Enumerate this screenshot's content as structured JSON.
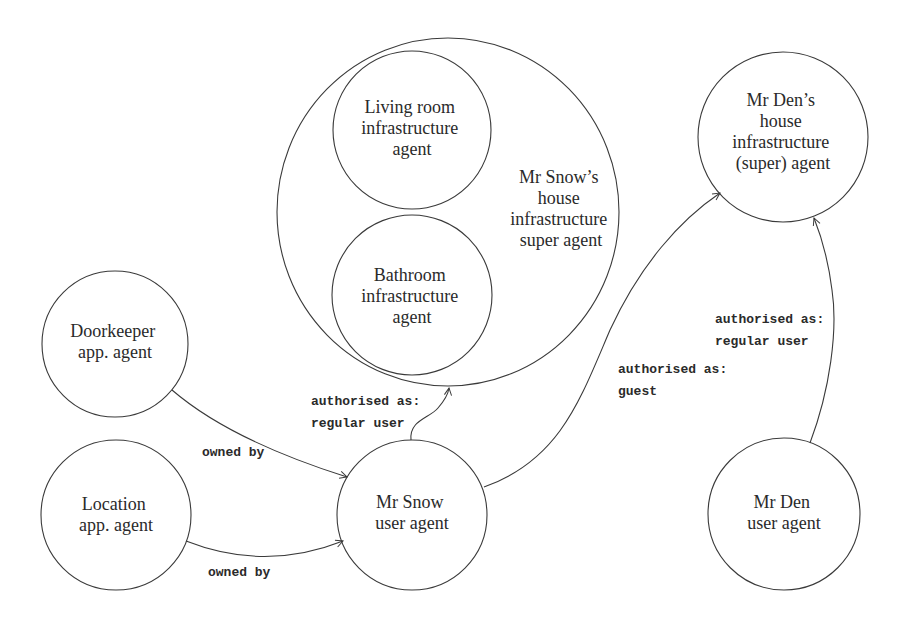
{
  "diagram": {
    "nodes": {
      "snow_house": {
        "lines": [
          "Mr Snow’s",
          "house",
          "infrastructure",
          "super agent"
        ]
      },
      "living_room": {
        "lines": [
          "Living room",
          "infrastructure",
          "agent"
        ]
      },
      "bathroom": {
        "lines": [
          "Bathroom",
          "infrastructure",
          "agent"
        ]
      },
      "den_house": {
        "lines": [
          "Mr Den’s",
          "house",
          "infrastructure",
          "(super) agent"
        ]
      },
      "doorkeeper": {
        "lines": [
          "Doorkeeper",
          "app. agent"
        ]
      },
      "location": {
        "lines": [
          "Location",
          "app. agent"
        ]
      },
      "snow_user": {
        "lines": [
          "Mr Snow",
          "user agent"
        ]
      },
      "den_user": {
        "lines": [
          "Mr Den",
          "user agent"
        ]
      }
    },
    "edges": {
      "doorkeeper_to_snow": {
        "from": "Doorkeeper app. agent",
        "to": "Mr Snow user agent",
        "lines": [
          "owned by"
        ]
      },
      "location_to_snow": {
        "from": "Location app. agent",
        "to": "Mr Snow user agent",
        "lines": [
          "owned by"
        ]
      },
      "snow_to_snow_house": {
        "from": "Mr Snow user agent",
        "to": "Mr Snow’s house infrastructure super agent",
        "lines": [
          "authorised as:",
          "regular user"
        ]
      },
      "snow_to_den_house": {
        "from": "Mr Snow user agent",
        "to": "Mr Den’s house infrastructure (super) agent",
        "lines": [
          "authorised as:",
          "guest"
        ]
      },
      "den_to_den_house": {
        "from": "Mr Den user agent",
        "to": "Mr Den’s house infrastructure (super) agent",
        "lines": [
          "authorised as:",
          "regular user"
        ]
      }
    }
  }
}
